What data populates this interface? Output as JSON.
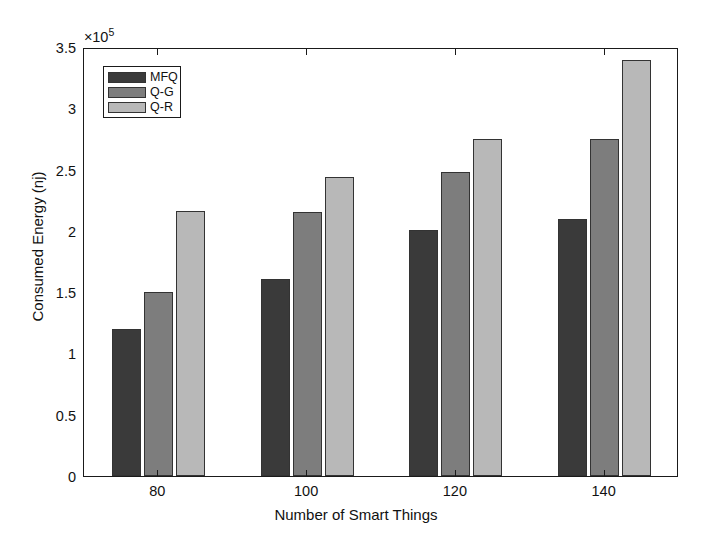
{
  "chart_data": {
    "type": "bar",
    "title": "",
    "xlabel": "Number of Smart Things",
    "ylabel": "Consumed Energy (nj)",
    "y_exponent_label": "×10",
    "y_exponent_power": "5",
    "categories": [
      "80",
      "100",
      "120",
      "140"
    ],
    "series": [
      {
        "name": "MFQ",
        "color": "#3a3a3a",
        "values": [
          1.2,
          1.61,
          2.01,
          2.1
        ]
      },
      {
        "name": "Q-G",
        "color": "#7d7d7d",
        "values": [
          1.5,
          2.15,
          2.48,
          2.75
        ]
      },
      {
        "name": "Q-R",
        "color": "#b8b8b8",
        "values": [
          2.16,
          2.44,
          2.75,
          3.39
        ]
      }
    ],
    "value_scale": "1e5",
    "ylim": [
      0,
      3.5
    ],
    "yticks": [
      "0",
      "0.5",
      "1",
      "1.5",
      "2",
      "2.5",
      "3",
      "3.5"
    ],
    "ytick_values": [
      0,
      0.5,
      1,
      1.5,
      2,
      2.5,
      3,
      3.5
    ],
    "grid": false,
    "legend_position": "upper-left",
    "legend_entries": [
      "MFQ",
      "Q-G",
      "Q-R"
    ]
  }
}
